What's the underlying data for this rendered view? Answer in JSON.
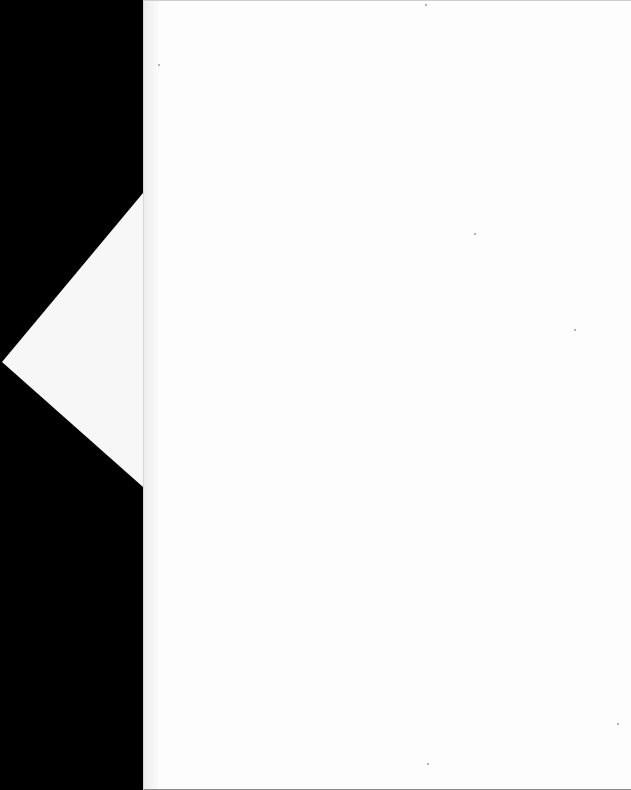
{
  "document": {
    "type": "scanned-page",
    "page_text": "",
    "background_color": "#000000",
    "page_color": "#fdfdfd",
    "flap_color": "#f7f7f7"
  }
}
